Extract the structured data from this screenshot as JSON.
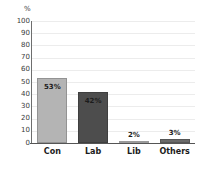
{
  "chart_data": {
    "type": "bar",
    "title": "",
    "xlabel": "",
    "ylabel": "%",
    "unit_label": "%",
    "categories": [
      "Con",
      "Lab",
      "Lib",
      "Others"
    ],
    "values": [
      53,
      42,
      2,
      3
    ],
    "data_labels": [
      "53%",
      "42%",
      "2%",
      "3%"
    ],
    "bar_colors": [
      "#b4b4b4",
      "#4d4d4d",
      "#bcbcbc",
      "#6a6a6a"
    ],
    "ylim": [
      0,
      100
    ],
    "yticks": [
      100,
      90,
      80,
      70,
      60,
      50,
      40,
      30,
      20,
      10,
      0
    ],
    "ytick_labels": [
      "100",
      "90",
      "80",
      "70",
      "60",
      "50",
      "40",
      "30",
      "20",
      "10",
      "0"
    ],
    "grid": true,
    "grid_color": "#ececec",
    "legend": "none",
    "background": "#ffffff",
    "axis_color": "#555555"
  }
}
